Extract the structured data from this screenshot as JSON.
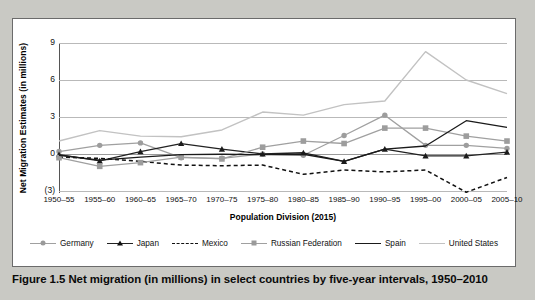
{
  "caption": "Figure 1.5  Net migration (in millions) in select countries by five-year intervals, 1950–2010",
  "axes": {
    "ylabel": "Net Migration Estimates (in millions)",
    "xlabel": "Population Division (2015)",
    "yticks": [
      "9",
      "6",
      "3",
      "0",
      "(3)"
    ]
  },
  "legend": [
    {
      "name": "Germany",
      "marker": "circle",
      "line": "solid",
      "color": "#a0a0a0"
    },
    {
      "name": "Japan",
      "marker": "triangle",
      "line": "solid",
      "color": "#222222"
    },
    {
      "name": "Mexico",
      "marker": "none",
      "line": "dashed",
      "color": "#111111"
    },
    {
      "name": "Russian Federation",
      "marker": "square",
      "line": "solid",
      "color": "#a0a0a0"
    },
    {
      "name": "Spain",
      "marker": "none",
      "line": "solid",
      "color": "#1a1a1a"
    },
    {
      "name": "United States",
      "marker": "none",
      "line": "solid",
      "color": "#c2c2c2"
    }
  ],
  "chart_data": {
    "type": "line",
    "title": "Net migration (in millions) in select countries by five-year intervals, 1950–2010",
    "xlabel": "Population Division (2015)",
    "ylabel": "Net Migration Estimates (in millions)",
    "ylim": [
      -3,
      9
    ],
    "yticks": [
      9,
      6,
      3,
      0,
      -3
    ],
    "grid": true,
    "legend_position": "bottom",
    "categories": [
      "1950–55",
      "1955–60",
      "1960–65",
      "1965–70",
      "1970–75",
      "1975–80",
      "1980–85",
      "1985–90",
      "1990–95",
      "1995–00",
      "2000–05",
      "2005–10"
    ],
    "series": [
      {
        "name": "Germany",
        "marker": "circle",
        "line": "solid",
        "color": "#a0a0a0",
        "values": [
          0.2,
          0.7,
          0.9,
          -0.3,
          -0.35,
          0.0,
          -0.1,
          1.5,
          3.15,
          0.7,
          0.7,
          0.45
        ]
      },
      {
        "name": "Japan",
        "marker": "triangle",
        "line": "solid",
        "color": "#222222",
        "values": [
          -0.05,
          -0.55,
          0.2,
          0.85,
          0.4,
          0.0,
          0.1,
          -0.6,
          0.4,
          -0.15,
          -0.15,
          0.15
        ]
      },
      {
        "name": "Mexico",
        "marker": "none",
        "line": "dashed",
        "color": "#111111",
        "values": [
          -0.25,
          -0.35,
          -0.6,
          -0.9,
          -0.95,
          -0.9,
          -1.65,
          -1.3,
          -1.45,
          -1.3,
          -3.1,
          -1.9
        ]
      },
      {
        "name": "Russian Federation",
        "marker": "square",
        "line": "solid",
        "color": "#a0a0a0",
        "values": [
          -0.3,
          -1.0,
          -0.7,
          -0.25,
          -0.4,
          0.55,
          1.05,
          0.85,
          2.1,
          2.1,
          1.45,
          1.05
        ]
      },
      {
        "name": "Spain",
        "marker": "none",
        "line": "solid",
        "color": "#1a1a1a",
        "values": [
          -0.1,
          -0.5,
          -0.25,
          -0.05,
          -0.02,
          -0.05,
          -0.02,
          -0.6,
          0.4,
          0.65,
          2.7,
          2.15
        ]
      },
      {
        "name": "United States",
        "marker": "none",
        "line": "solid",
        "color": "#c2c2c2",
        "values": [
          1.05,
          1.9,
          1.45,
          1.4,
          1.95,
          3.4,
          3.15,
          4.0,
          4.3,
          8.3,
          6.0,
          4.9
        ]
      }
    ]
  }
}
